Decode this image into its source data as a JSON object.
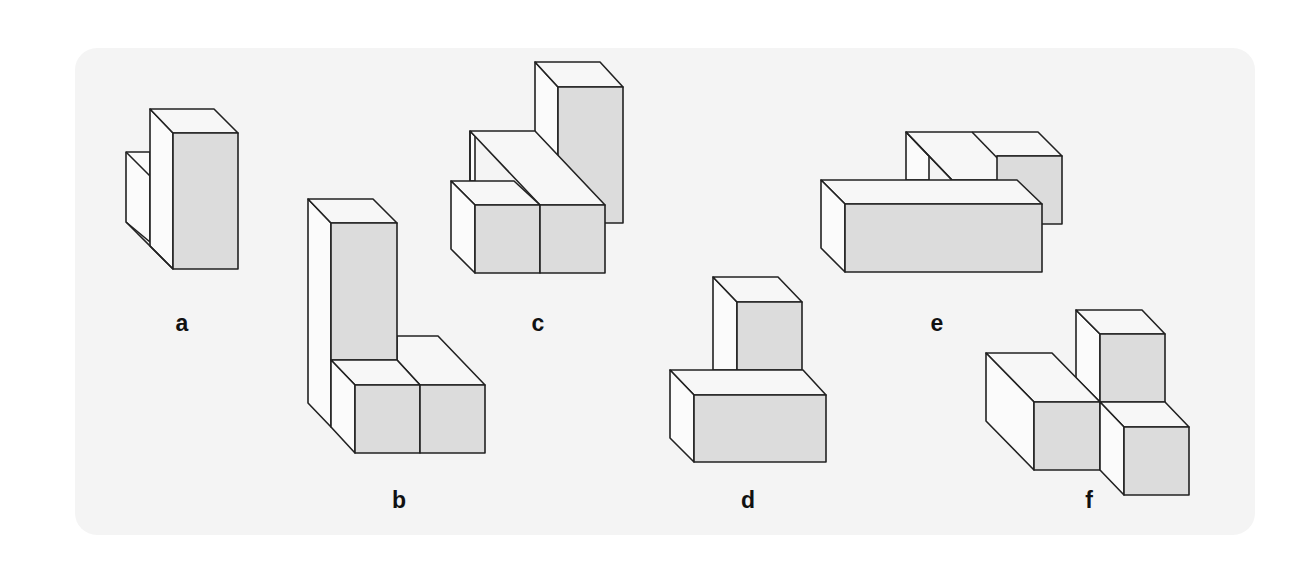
{
  "figure": {
    "colors": {
      "panel_background": "#f4f4f4",
      "front_face": "#dcdcdc",
      "top_face": "#f7f7f7",
      "side_face": "#fbfbfb",
      "outline": "#222222",
      "label": "#111111"
    },
    "shapes": [
      {
        "id": "a",
        "label": "a"
      },
      {
        "id": "b",
        "label": "b"
      },
      {
        "id": "c",
        "label": "c"
      },
      {
        "id": "d",
        "label": "d"
      },
      {
        "id": "e",
        "label": "e"
      },
      {
        "id": "f",
        "label": "f"
      }
    ]
  }
}
